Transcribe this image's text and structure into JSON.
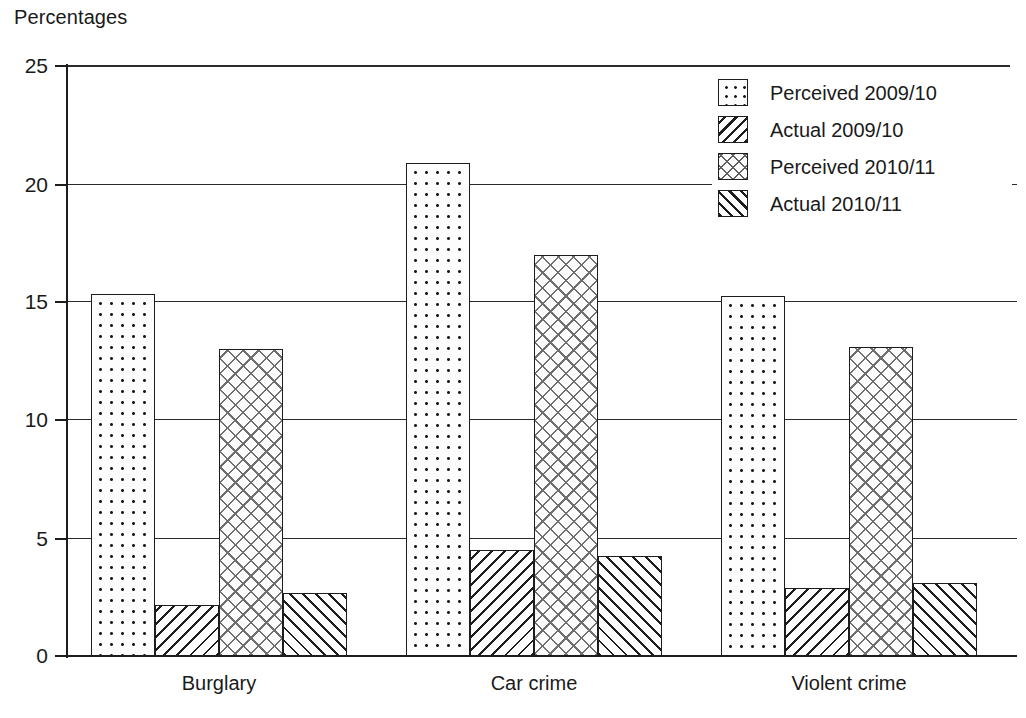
{
  "chart_data": {
    "type": "bar",
    "title": "",
    "xlabel": "",
    "ylabel": "Percentages",
    "ylim": [
      0,
      25
    ],
    "yticks": [
      "0",
      "5",
      "10",
      "15",
      "20",
      "25"
    ],
    "ytick_values": [
      0,
      5,
      10,
      15,
      20,
      25
    ],
    "grid": true,
    "legend_position": "top-right",
    "categories": [
      "Burglary",
      "Car crime",
      "Violent crime"
    ],
    "series": [
      {
        "name": "Perceived 2009/10",
        "pattern": "dots",
        "values": [
          15.35,
          20.9,
          15.25
        ]
      },
      {
        "name": "Actual 2009/10",
        "pattern": "back-hatch",
        "values": [
          2.15,
          4.5,
          2.9
        ]
      },
      {
        "name": "Perceived 2010/11",
        "pattern": "cross-hatch",
        "values": [
          13.0,
          17.0,
          13.1
        ]
      },
      {
        "name": "Actual 2010/11",
        "pattern": "forward-hatch",
        "values": [
          2.65,
          4.25,
          3.1
        ]
      }
    ]
  },
  "axis": {
    "y_title": "Percentages",
    "tick_0": "0",
    "tick_5": "5",
    "tick_10": "10",
    "tick_15": "15",
    "tick_20": "20",
    "tick_25": "25"
  },
  "categories": {
    "burglary": "Burglary",
    "car_crime": "Car crime",
    "violent_crime": "Violent crime"
  },
  "legend": {
    "items": [
      {
        "label": "Perceived 2009/10",
        "icon": "dotted-swatch-icon"
      },
      {
        "label": "Actual 2009/10",
        "icon": "back-hatch-swatch-icon"
      },
      {
        "label": "Perceived 2010/11",
        "icon": "cross-hatch-swatch-icon"
      },
      {
        "label": "Actual 2010/11",
        "icon": "forward-hatch-swatch-icon"
      }
    ]
  },
  "colors": {
    "ink": "#1d1d1d",
    "grid": "#2b2b2b",
    "background": "#ffffff"
  }
}
